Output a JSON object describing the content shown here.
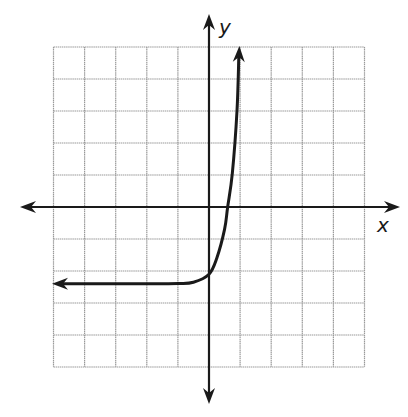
{
  "chart_data": {
    "type": "line",
    "title": "",
    "xlabel": "x",
    "ylabel": "y",
    "grid": true,
    "xlim": [
      -5,
      5
    ],
    "ylim": [
      -5,
      5
    ],
    "grid_step": 1,
    "tick_labels": [],
    "series": [
      {
        "name": "exponential curve",
        "description": "Exponential growth curve with horizontal asymptote near y = -2.4, y-intercept near -2.1, x-intercept near 0.6, arrows at both ends",
        "asymptote_y": -2.4,
        "y_intercept": -2.1,
        "x_intercept": 0.6,
        "x": [
          -5.0,
          -3.0,
          -2.0,
          -1.0,
          -0.5,
          0.0,
          0.25,
          0.5,
          0.6,
          0.75,
          0.9,
          0.96
        ],
        "y": [
          -2.4,
          -2.4,
          -2.4,
          -2.39,
          -2.35,
          -2.1,
          -1.6,
          -0.7,
          0.0,
          1.05,
          3.0,
          5.0
        ]
      }
    ]
  },
  "labels": {
    "x_axis": "x",
    "y_axis": "y"
  },
  "colors": {
    "axis": "#1a1a1a",
    "grid": "#9a9a9a",
    "curve": "#1a1a1a",
    "background": "#ffffff"
  }
}
